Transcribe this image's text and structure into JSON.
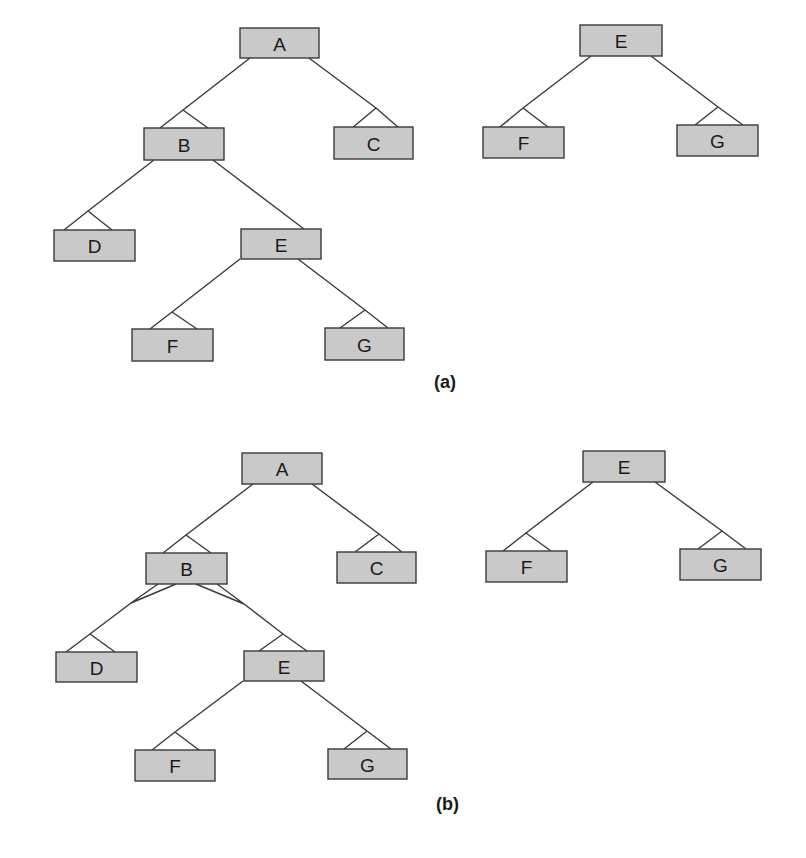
{
  "figure": {
    "panels": [
      {
        "caption": "(a)",
        "caption_pos": [
          434,
          372
        ],
        "nodes": [
          {
            "id": "a-A",
            "label": "A",
            "x": 240,
            "y": 28,
            "w": 79,
            "h": 30
          },
          {
            "id": "a-B",
            "label": "B",
            "x": 144,
            "y": 128,
            "w": 80,
            "h": 32
          },
          {
            "id": "a-C",
            "label": "C",
            "x": 334,
            "y": 127,
            "w": 79,
            "h": 32
          },
          {
            "id": "a-D",
            "label": "D",
            "x": 54,
            "y": 230,
            "w": 81,
            "h": 31
          },
          {
            "id": "a-E",
            "label": "E",
            "x": 241,
            "y": 229,
            "w": 80,
            "h": 30
          },
          {
            "id": "a-F",
            "label": "F",
            "x": 132,
            "y": 329,
            "w": 81,
            "h": 32
          },
          {
            "id": "a-G",
            "label": "G",
            "x": 325,
            "y": 328,
            "w": 79,
            "h": 32
          },
          {
            "id": "a-E2",
            "label": "E",
            "x": 580,
            "y": 25,
            "w": 82,
            "h": 31
          },
          {
            "id": "a-F2",
            "label": "F",
            "x": 483,
            "y": 127,
            "w": 81,
            "h": 31
          },
          {
            "id": "a-G2",
            "label": "G",
            "x": 677,
            "y": 125,
            "w": 81,
            "h": 31
          }
        ],
        "edges": [
          {
            "from": "A",
            "to": "B",
            "path": "M250,58 L183,110 M183,110 L160,128 M183,110 L208,128"
          },
          {
            "from": "A",
            "to": "C",
            "path": "M309,58 L376,108 M376,108 L352,128 M376,108 L399,128"
          },
          {
            "from": "B",
            "to": "D",
            "path": "M154,160 L88,211 M88,211 L64,230 M88,211 L112,230"
          },
          {
            "from": "B",
            "to": "E",
            "path": "M213,160 L304,229"
          },
          {
            "from": "E",
            "to": "F",
            "path": "M240,259 L172,312 M172,312 L150,329 M172,312 L197,329"
          },
          {
            "from": "E",
            "to": "G",
            "path": "M298,259 L365,310 M365,310 L340,328 M365,310 L388,328"
          },
          {
            "from": "E",
            "to": "F",
            "path": "M591,56 L523,108 M523,108 L500,127 M523,108 L548,127"
          },
          {
            "from": "E",
            "to": "G",
            "path": "M651,56 L718,107 M718,107 L695,125 M718,107 L743,125"
          }
        ]
      },
      {
        "caption": "(b)",
        "caption_pos": [
          436,
          794
        ],
        "nodes": [
          {
            "id": "b-A",
            "label": "A",
            "x": 242,
            "y": 453,
            "w": 80,
            "h": 31
          },
          {
            "id": "b-B",
            "label": "B",
            "x": 146,
            "y": 553,
            "w": 81,
            "h": 31
          },
          {
            "id": "b-C",
            "label": "C",
            "x": 337,
            "y": 552,
            "w": 79,
            "h": 31
          },
          {
            "id": "b-D",
            "label": "D",
            "x": 56,
            "y": 652,
            "w": 81,
            "h": 30
          },
          {
            "id": "b-E",
            "label": "E",
            "x": 244,
            "y": 651,
            "w": 80,
            "h": 30
          },
          {
            "id": "b-F",
            "label": "F",
            "x": 135,
            "y": 750,
            "w": 80,
            "h": 31
          },
          {
            "id": "b-G",
            "label": "G",
            "x": 328,
            "y": 749,
            "w": 79,
            "h": 30
          },
          {
            "id": "b-E2",
            "label": "E",
            "x": 583,
            "y": 451,
            "w": 82,
            "h": 31
          },
          {
            "id": "b-F2",
            "label": "F",
            "x": 486,
            "y": 551,
            "w": 81,
            "h": 31
          },
          {
            "id": "b-G2",
            "label": "G",
            "x": 680,
            "y": 549,
            "w": 81,
            "h": 31
          }
        ],
        "edges": [
          {
            "from": "A",
            "to": "B",
            "path": "M253,484 L186,535 M186,535 L163,553 M186,535 L211,553"
          },
          {
            "from": "A",
            "to": "C",
            "path": "M312,484 L379,534 M379,534 L355,552 M379,534 L402,552"
          },
          {
            "from": "B",
            "to": "D",
            "path": "M158,584 L131,603 M176,584 L131,603 M131,603 L90,634 M90,634 L66,652 M90,634 L115,652"
          },
          {
            "from": "B",
            "to": "E",
            "path": "M196,584 L244,604 M217,584 L244,604 M244,604 L283,634 M283,634 L259,651 M283,634 L307,651"
          },
          {
            "from": "E",
            "to": "F",
            "path": "M243,681 L175,732 M175,732 L152,750 M175,732 L199,750"
          },
          {
            "from": "E",
            "to": "G",
            "path": "M301,681 L367,731 M367,731 L344,749 M367,731 L391,749"
          },
          {
            "from": "E",
            "to": "F",
            "path": "M593,482 L526,533 M526,533 L503,551 M526,533 L551,551"
          },
          {
            "from": "E",
            "to": "G",
            "path": "M655,482 L722,531 M722,531 L698,549 M722,531 L746,549"
          }
        ]
      }
    ],
    "colors": {
      "node_fill": "#c9c9c9",
      "stroke": "#3a3a3a",
      "text": "#1a1a1a"
    }
  }
}
